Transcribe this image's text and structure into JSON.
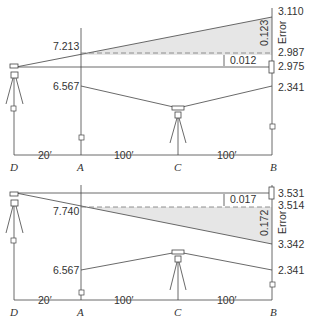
{
  "points": {
    "D": "D",
    "A": "A",
    "C": "C",
    "B": "B"
  },
  "distances": {
    "DA": "20′",
    "AC": "100′",
    "CB": "100′"
  },
  "top": {
    "A_high": "7.213",
    "A_low": "6.567",
    "B_high": "3.110",
    "B_dash": "2.987",
    "B_rod": "2.975",
    "B_low": "2.341",
    "error_value": "0.123",
    "error_label": "Error",
    "diff": "0.012"
  },
  "bottom": {
    "A_high": "7.740",
    "A_low": "6.567",
    "B_rod": "3.531",
    "B_dash": "3.514",
    "B_high": "3.342",
    "B_low": "2.341",
    "error_value": "0.172",
    "error_label": "Error",
    "diff": "0.017"
  }
}
